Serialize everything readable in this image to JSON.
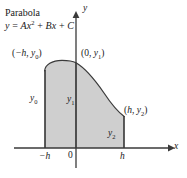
{
  "figure": {
    "title_line1": "Parabola",
    "equation": {
      "lhs": "y",
      "eq": " = ",
      "term_a_coef": "A",
      "term_a_var": "x",
      "term_a_exp": "2",
      "plus1": " + ",
      "term_b_coef": "B",
      "term_b_var": "x",
      "plus2": " + ",
      "term_c": "C"
    },
    "axes": {
      "x_label": "x",
      "y_label": "y",
      "ticks": {
        "left": "−h",
        "origin": "0",
        "right": "h"
      }
    },
    "point_labels": {
      "left": {
        "open": "(",
        "x": "−h",
        "comma": ", ",
        "y": "y",
        "y_sub": "0",
        "close": ")"
      },
      "middle": {
        "open": "(",
        "x": "0",
        "comma": ", ",
        "y": "y",
        "y_sub": "1",
        "close": ")"
      },
      "right": {
        "open": "(",
        "x": "h",
        "comma": ", ",
        "y": "y",
        "y_sub": "2",
        "close": ")"
      }
    },
    "ordinate_labels": {
      "left": {
        "base": "y",
        "sub": "0"
      },
      "middle": {
        "base": "y",
        "sub": "1"
      },
      "right": {
        "base": "y",
        "sub": "2"
      }
    },
    "colors": {
      "fill": "#cfcfcf",
      "stroke": "#3a3a3a",
      "axis": "#3a3a3a",
      "text": "#1a1a1a",
      "background": "#ffffff"
    },
    "geometry": {
      "x_axis_y": 148,
      "y_axis_x": 76,
      "x_at_minus_h": 45,
      "x_at_plus_h": 124,
      "curve_vertex_x": 62,
      "curve_y_at_minus_h": 67,
      "curve_y_at_zero": 62,
      "curve_y_at_plus_h": 116
    }
  }
}
